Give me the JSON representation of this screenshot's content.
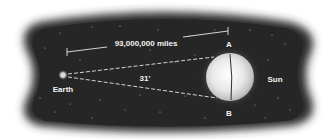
{
  "diagram": {
    "distance_label": "93,000,000 miles",
    "angle_label": "31'",
    "earth_label": "Earth",
    "sun_label": "Sun",
    "point_a_label": "A",
    "point_b_label": "B"
  },
  "colors": {
    "space": "#2b2b2b",
    "sun_core": "#f7f7f7",
    "sun_edge": "#b8b8b8",
    "text": "#f2f2f2"
  }
}
